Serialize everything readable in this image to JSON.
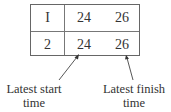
{
  "table": {
    "rows": [
      {
        "id": "I",
        "start": "24",
        "finish": "26"
      },
      {
        "id": "2",
        "start": "24",
        "finish": "26"
      }
    ]
  },
  "annotations": {
    "start": {
      "line1": "Latest start",
      "line2": "time"
    },
    "finish": {
      "line1": "Latest finish",
      "line2": "time"
    }
  }
}
